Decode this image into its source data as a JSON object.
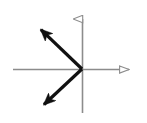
{
  "figure": {
    "background_color": "#ffffff",
    "width": 147,
    "height": 123,
    "origin": {
      "x": 82,
      "y": 69
    },
    "axes": {
      "color": "#8c8c8c",
      "stroke_width": 1.6,
      "arrowhead_style": "hollow-outline",
      "x_axis": {
        "name": "horizontal-axis",
        "x_start": 13,
        "y_start": 69,
        "x_end": 137,
        "y_end": 69,
        "arrow_at": "right-end"
      },
      "y_axis": {
        "name": "vertical-axis",
        "x_start": 82,
        "y_start": 113,
        "x_end": 82,
        "y_end": 10,
        "arrow_at": "top-end"
      }
    },
    "vectors": [
      {
        "name": "vector-upper-left",
        "color": "#111111",
        "stroke_width": 3.2,
        "arrowhead_style": "solid-filled",
        "tail": {
          "x": 82,
          "y": 69
        },
        "tip": {
          "x": 33,
          "y": 22
        },
        "direction": "upper-left",
        "angle_degrees": 136,
        "length_px": 68
      },
      {
        "name": "vector-lower-left",
        "color": "#111111",
        "stroke_width": 3.2,
        "arrowhead_style": "solid-filled",
        "tail": {
          "x": 82,
          "y": 69
        },
        "tip": {
          "x": 36,
          "y": 112
        },
        "direction": "lower-left",
        "angle_degrees": 223,
        "length_px": 63
      }
    ],
    "labels": []
  }
}
